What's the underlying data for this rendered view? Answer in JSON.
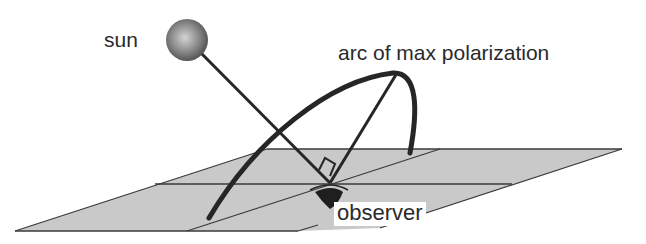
{
  "diagram": {
    "type": "physics-illustration",
    "labels": {
      "sun": "sun",
      "arc": "arc of max polarization",
      "observer": "observer"
    },
    "elements": [
      {
        "name": "sun",
        "shape": "shaded sphere"
      },
      {
        "name": "sun-ray",
        "shape": "line from sun to observer"
      },
      {
        "name": "arc-of-max-polarization",
        "shape": "curved arc over ground plane"
      },
      {
        "name": "perpendicular-line",
        "shape": "line from observer to arc, at right angle to sun ray"
      },
      {
        "name": "right-angle-marker",
        "shape": "small square at observer"
      },
      {
        "name": "ground-plane",
        "shape": "gray parallelogram with grid lines"
      },
      {
        "name": "observer-eye",
        "shape": "eye symbol"
      }
    ],
    "colors": {
      "ground_fill": "#c8c8c8",
      "line": "#2a2a2a",
      "sun_light": "#cfcfcf",
      "sun_dark": "#555555",
      "background": "#ffffff"
    }
  }
}
